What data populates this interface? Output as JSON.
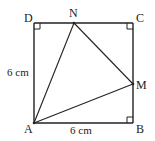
{
  "diagram": {
    "type": "geometry",
    "shape": "square ABCD with triangle AMN inscribed",
    "points": {
      "A": {
        "label": "A",
        "x": 34,
        "y": 123
      },
      "B": {
        "label": "B",
        "x": 133,
        "y": 123
      },
      "C": {
        "label": "C",
        "x": 133,
        "y": 23
      },
      "D": {
        "label": "D",
        "x": 34,
        "y": 23
      },
      "N": {
        "label": "N",
        "x": 74,
        "y": 23
      },
      "M": {
        "label": "M",
        "x": 133,
        "y": 84
      }
    },
    "dimensions": {
      "left_side": "6 cm",
      "bottom_side": "6 cm"
    },
    "right_angle_marks": [
      "D",
      "C",
      "B"
    ],
    "segments": [
      "AB",
      "BC",
      "CD",
      "DA",
      "AN",
      "NM",
      "AM"
    ]
  }
}
